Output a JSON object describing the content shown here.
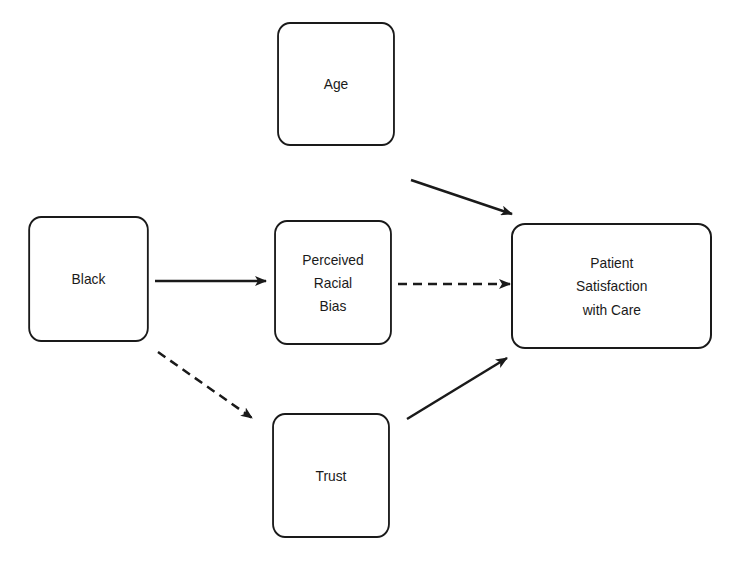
{
  "diagram": {
    "nodes": {
      "age": {
        "label": "Age"
      },
      "black": {
        "label": "Black"
      },
      "bias": {
        "lines": [
          "Perceived",
          "Racial",
          "Bias"
        ]
      },
      "trust": {
        "label": "Trust"
      },
      "satisfaction": {
        "lines": [
          "Patient",
          "Satisfaction",
          "with Care"
        ]
      }
    },
    "edges": [
      {
        "from": "Black",
        "to": "Perceived Racial Bias",
        "style": "solid"
      },
      {
        "from": "Black",
        "to": "Trust",
        "style": "dashed"
      },
      {
        "from": "Age",
        "to": "Patient Satisfaction with Care",
        "style": "solid"
      },
      {
        "from": "Perceived Racial Bias",
        "to": "Patient Satisfaction with Care",
        "style": "dashed"
      },
      {
        "from": "Trust",
        "to": "Patient Satisfaction with Care",
        "style": "solid"
      }
    ],
    "colors": {
      "stroke": "#1a1a1a",
      "background": "#ffffff"
    }
  }
}
